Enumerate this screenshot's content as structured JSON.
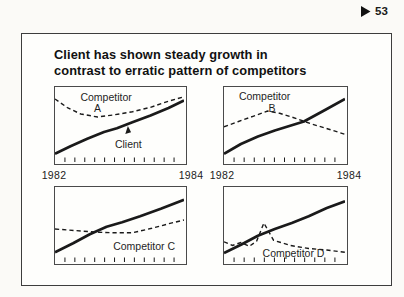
{
  "page_marker": {
    "icon": "right-triangle",
    "number": "53"
  },
  "slide": {
    "title_line1": "Client has shown steady growth in",
    "title_line2": "contrast to erratic pattern of competitors"
  },
  "colors": {
    "ink": "#1a1a1a",
    "panel_border": "#4a4a4a",
    "slide_border": "#3d3d3d",
    "background": "#fbfaf7"
  },
  "chart_data": [
    {
      "position": "top-left",
      "type": "line",
      "x_range": [
        "1982",
        "1984"
      ],
      "x_start_label": "1982",
      "x_end_label": "1984",
      "tick_count": 12,
      "y_units": "relative index 0-100 (unlabeled axis, estimated from pixels)",
      "labels": {
        "competitor_line1": "Competitor",
        "competitor_line2": "A",
        "client": "Client"
      },
      "annotation": {
        "type": "arrowhead",
        "target": "Client",
        "x": 56.5,
        "y": 48
      },
      "series": [
        {
          "name": "Client",
          "line": "solid",
          "points": [
            [
              0,
              11
            ],
            [
              12,
              21
            ],
            [
              25,
              31
            ],
            [
              38,
              40
            ],
            [
              48,
              45
            ],
            [
              60,
              53
            ],
            [
              74,
              62
            ],
            [
              88,
              72
            ],
            [
              100,
              82
            ]
          ]
        },
        {
          "name": "Competitor A",
          "line": "dashed",
          "points": [
            [
              0,
              84
            ],
            [
              10,
              72
            ],
            [
              20,
              64
            ],
            [
              33,
              60
            ],
            [
              46,
              63
            ],
            [
              60,
              67
            ],
            [
              74,
              73
            ],
            [
              88,
              81
            ],
            [
              100,
              87
            ]
          ]
        }
      ]
    },
    {
      "position": "top-right",
      "type": "line",
      "x_range": [
        "1982",
        "1984"
      ],
      "x_start_label": "1982",
      "x_end_label": "1984",
      "tick_count": 11,
      "y_units": "relative index 0-100 (unlabeled axis, estimated from pixels)",
      "labels": {
        "competitor_line1": "Competitor",
        "competitor_line2": "B"
      },
      "series": [
        {
          "name": "Client",
          "line": "solid",
          "points": [
            [
              0,
              11
            ],
            [
              14,
              24
            ],
            [
              28,
              34
            ],
            [
              42,
              42
            ],
            [
              52,
              47
            ],
            [
              66,
              54
            ],
            [
              82,
              68
            ],
            [
              100,
              84
            ]
          ]
        },
        {
          "name": "Competitor B",
          "line": "dashed",
          "points": [
            [
              0,
              47
            ],
            [
              12,
              54
            ],
            [
              24,
              61
            ],
            [
              36,
              68
            ],
            [
              46,
              65
            ],
            [
              56,
              60
            ],
            [
              72,
              51
            ],
            [
              86,
              44
            ],
            [
              100,
              37
            ]
          ]
        }
      ]
    },
    {
      "position": "bottom-left",
      "type": "line",
      "x_range": [
        "1982",
        "1984"
      ],
      "tick_count": 12,
      "y_units": "relative index 0-100 (unlabeled axis, estimated from pixels)",
      "labels": {
        "competitor": "Competitor C"
      },
      "series": [
        {
          "name": "Client",
          "line": "solid",
          "points": [
            [
              0,
              13
            ],
            [
              14,
              25
            ],
            [
              27,
              37
            ],
            [
              40,
              47
            ],
            [
              52,
              53
            ],
            [
              66,
              61
            ],
            [
              82,
              71
            ],
            [
              100,
              83
            ]
          ]
        },
        {
          "name": "Competitor C",
          "line": "dashed",
          "points": [
            [
              0,
              44
            ],
            [
              15,
              42
            ],
            [
              30,
              40
            ],
            [
              45,
              39
            ],
            [
              60,
              39
            ],
            [
              75,
              45
            ],
            [
              88,
              51
            ],
            [
              100,
              56
            ]
          ]
        }
      ]
    },
    {
      "position": "bottom-right",
      "type": "line",
      "x_range": [
        "1982",
        "1984"
      ],
      "tick_count": 11,
      "y_units": "relative index 0-100 (unlabeled axis, estimated from pixels)",
      "labels": {
        "competitor": "Competitor D"
      },
      "series": [
        {
          "name": "Client",
          "line": "solid",
          "points": [
            [
              0,
              12
            ],
            [
              14,
              23
            ],
            [
              28,
              35
            ],
            [
              42,
              44
            ],
            [
              56,
              52
            ],
            [
              70,
              61
            ],
            [
              85,
              72
            ],
            [
              100,
              81
            ]
          ]
        },
        {
          "name": "Competitor D",
          "line": "dashed",
          "points": [
            [
              0,
              27
            ],
            [
              7,
              22
            ],
            [
              14,
              26
            ],
            [
              21,
              21
            ],
            [
              27,
              28
            ],
            [
              33,
              52
            ],
            [
              41,
              29
            ],
            [
              55,
              22
            ],
            [
              70,
              18
            ],
            [
              85,
              16
            ],
            [
              100,
              13
            ]
          ]
        }
      ]
    }
  ]
}
